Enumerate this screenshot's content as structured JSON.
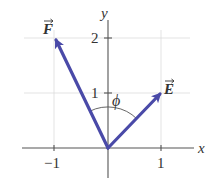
{
  "diagram": {
    "type": "vector-diagram",
    "axes": {
      "x_label": "x",
      "y_label": "y",
      "x_ticks": [
        {
          "value": -1,
          "label": "−1"
        },
        {
          "value": 1,
          "label": "1"
        }
      ],
      "y_ticks": [
        {
          "value": 1,
          "label": "1"
        },
        {
          "value": 2,
          "label": "2"
        }
      ],
      "grid": true
    },
    "vectors": [
      {
        "name": "E",
        "label": "E",
        "from": [
          0,
          0
        ],
        "to": [
          1,
          1
        ],
        "color": "#4a4aa8"
      },
      {
        "name": "F",
        "label": "F",
        "from": [
          0,
          0
        ],
        "to": [
          -1,
          2
        ],
        "color": "#4a4aa8"
      }
    ],
    "angle": {
      "label": "ϕ",
      "between": [
        "E",
        "F"
      ]
    },
    "colors": {
      "vector": "#4a4aa8",
      "axis": "#555555",
      "grid": "#d8d8d8",
      "text": "#333333"
    }
  }
}
